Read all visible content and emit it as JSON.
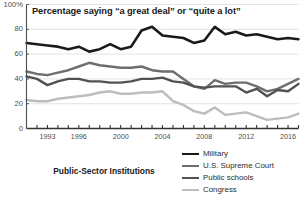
{
  "chart_data": {
    "type": "line",
    "title": "Percentage saying “a great deal” or “quite a lot”",
    "caption": "Public-Sector Institutions",
    "xlabel": "",
    "ylabel": "",
    "ylim": [
      0,
      100
    ],
    "ytick_values": [
      0,
      20,
      40,
      60,
      80,
      100
    ],
    "ytick_labels": [
      "0",
      "20",
      "40",
      "60",
      "80",
      "100%"
    ],
    "grid": true,
    "legend_position": "bottom-right",
    "xlim": [
      1991,
      2017
    ],
    "x": [
      1991,
      1992,
      1993,
      1994,
      1995,
      1996,
      1997,
      1998,
      1999,
      2000,
      2001,
      2002,
      2003,
      2004,
      2005,
      2006,
      2007,
      2008,
      2009,
      2010,
      2011,
      2012,
      2013,
      2014,
      2015,
      2016,
      2017
    ],
    "xtick_values": [
      1993,
      1996,
      2000,
      2004,
      2008,
      2012,
      2016
    ],
    "xtick_labels": [
      "1993",
      "1996",
      "2000",
      "2004",
      "2008",
      "2012",
      "2016"
    ],
    "series": [
      {
        "name": "Military",
        "color": "#1a1a1a",
        "width": 2.6,
        "values": [
          69,
          68,
          67,
          66,
          64,
          66,
          62,
          64,
          68,
          64,
          66,
          79,
          82,
          75,
          74,
          73,
          69,
          71,
          82,
          76,
          78,
          75,
          76,
          74,
          72,
          73,
          72
        ]
      },
      {
        "name": "U.S. Supreme Court",
        "color": "#6e6e6e",
        "width": 2.4,
        "values": [
          46,
          44,
          43,
          45,
          47,
          50,
          53,
          51,
          50,
          49,
          49,
          50,
          47,
          46,
          46,
          40,
          34,
          32,
          39,
          36,
          37,
          37,
          34,
          30,
          32,
          36,
          40
        ]
      },
      {
        "name": "Public schools",
        "color": "#515151",
        "width": 2.4,
        "values": [
          42,
          40,
          35,
          38,
          40,
          40,
          38,
          38,
          37,
          37,
          38,
          40,
          40,
          41,
          38,
          37,
          34,
          33,
          34,
          34,
          34,
          29,
          32,
          26,
          31,
          30,
          36
        ]
      },
      {
        "name": "Congress",
        "color": "#bdbdbd",
        "width": 2.4,
        "values": [
          23,
          22,
          22,
          24,
          25,
          26,
          27,
          29,
          30,
          28,
          28,
          29,
          29,
          30,
          22,
          19,
          14,
          12,
          17,
          11,
          12,
          13,
          10,
          7,
          8,
          9,
          12
        ]
      }
    ]
  },
  "legend": {
    "items": [
      {
        "label": "Military"
      },
      {
        "label": "U.S. Supreme Court"
      },
      {
        "label": "Public schools"
      },
      {
        "label": "Congress"
      }
    ]
  }
}
